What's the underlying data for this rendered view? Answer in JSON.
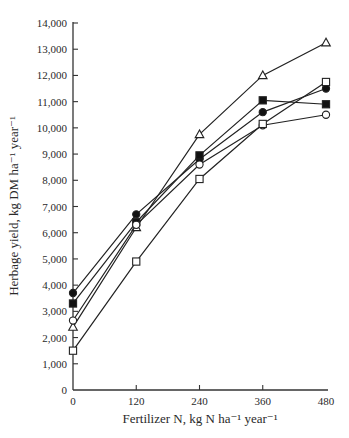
{
  "chart_data": {
    "type": "line",
    "title": "",
    "xlabel": "Fertilizer N, kg N ha⁻¹  year⁻¹",
    "ylabel": "Herbage yield, kg DM ha⁻¹  year⁻¹",
    "x": [
      0,
      120,
      240,
      360,
      480
    ],
    "x_ticks": [
      "0",
      "120",
      "240",
      "360",
      "480"
    ],
    "y_ticks": [
      "0",
      "1,000",
      "2,000",
      "3,000",
      "4,000",
      "5,000",
      "6,000",
      "7,000",
      "8,000",
      "9,000",
      "10,000",
      "11,000",
      "12,000",
      "13,000",
      "14,000"
    ],
    "xlim": [
      0,
      480
    ],
    "ylim": [
      0,
      14000
    ],
    "grid": false,
    "legend": "none",
    "series": [
      {
        "name": "open triangle",
        "marker": "triangle-open",
        "values": [
          2400,
          6200,
          9750,
          12000,
          13250
        ]
      },
      {
        "name": "filled circle",
        "marker": "circle-filled",
        "values": [
          3700,
          6700,
          8800,
          10600,
          11500
        ]
      },
      {
        "name": "filled square",
        "marker": "square-filled",
        "values": [
          3300,
          6400,
          8950,
          11050,
          10900
        ]
      },
      {
        "name": "open circle",
        "marker": "circle-open",
        "values": [
          2650,
          6300,
          8600,
          10100,
          10500
        ]
      },
      {
        "name": "open square",
        "marker": "square-open",
        "values": [
          1500,
          4900,
          8050,
          10150,
          11750
        ]
      }
    ]
  }
}
